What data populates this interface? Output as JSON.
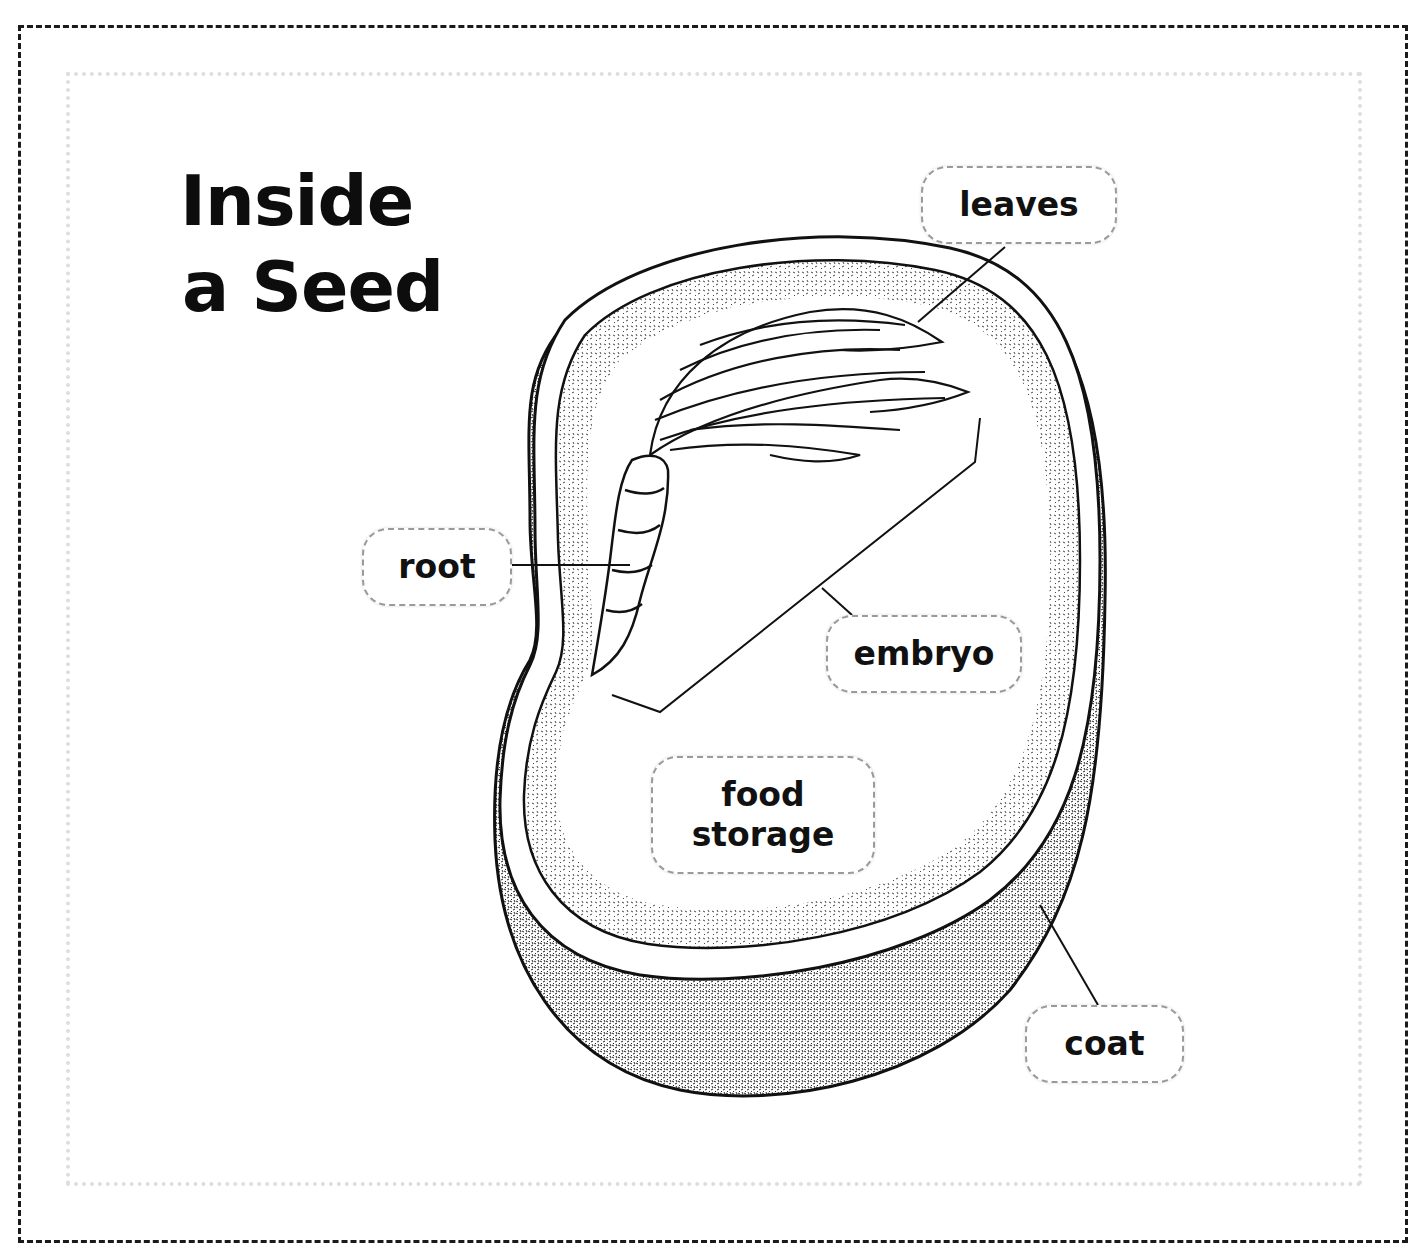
{
  "diagram": {
    "title": {
      "line1": "Inside",
      "line2": "a Seed"
    },
    "labels": {
      "leaves": "leaves",
      "root": "root",
      "embryo": "embryo",
      "food_storage_line1": "food",
      "food_storage_line2": "storage",
      "coat": "coat"
    },
    "parts": [
      "leaves",
      "root",
      "embryo",
      "food storage",
      "coat"
    ],
    "colors": {
      "ink": "#111111",
      "frame_dash": "#1a1a1a",
      "inner_dots": "#dedede",
      "label_border": "#9a9a9a",
      "background": "#ffffff"
    }
  }
}
